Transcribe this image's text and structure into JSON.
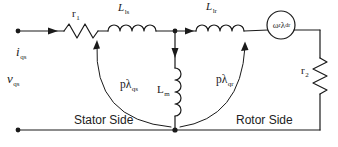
{
  "figure": {
    "type": "circuit-diagram",
    "background_color": "#ffffff",
    "line_color": "#1a1a1a"
  },
  "labels": {
    "stator_current": {
      "main": "i",
      "sub": "qs"
    },
    "stator_voltage": {
      "main": "v",
      "sub": "qs"
    },
    "stator_resistance": {
      "main": "r",
      "sub": "1"
    },
    "stator_leakage_inductance": {
      "main": "L",
      "sub": "ls"
    },
    "rotor_leakage_inductance": {
      "main": "L",
      "sub": "lr"
    },
    "magnetizing_inductance": {
      "main": "L",
      "sub": "m"
    },
    "rotor_resistance": {
      "main": "r",
      "sub": "2"
    },
    "stator_flux_term": {
      "main": "pλ",
      "sub": "qs"
    },
    "rotor_flux_term": {
      "main": "pλ",
      "sub": "qr"
    },
    "speed_emf_source": {
      "omega": "ω",
      "omega_sub": "r",
      "lambda": "λ",
      "lambda_sub": "dr"
    },
    "stator_side": "Stator Side",
    "rotor_side": "Rotor Side"
  }
}
